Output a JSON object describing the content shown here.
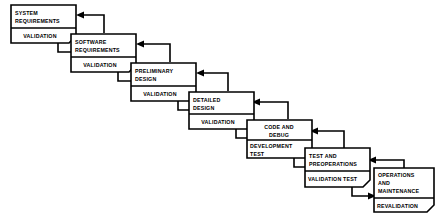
{
  "diagram": {
    "type": "waterfall-model",
    "stages": [
      {
        "id": "system-requirements",
        "phase_lines": [
          "SYSTEM",
          "REQUIREMENTS"
        ],
        "phase_align": "start",
        "validation_lines": [
          "VALIDATION"
        ],
        "validation_align": "center"
      },
      {
        "id": "software-requirements",
        "phase_lines": [
          "SOFTWARE",
          "REQUIREMENTS"
        ],
        "phase_align": "start",
        "validation_lines": [
          "VALIDATION"
        ],
        "validation_align": "center"
      },
      {
        "id": "preliminary-design",
        "phase_lines": [
          "PRELIMINARY",
          "DESIGN"
        ],
        "phase_align": "start",
        "validation_lines": [
          "VALIDATION"
        ],
        "validation_align": "center"
      },
      {
        "id": "detailed-design",
        "phase_lines": [
          "DETAILED",
          "DESIGN"
        ],
        "phase_align": "start",
        "validation_lines": [
          "VALIDATION"
        ],
        "validation_align": "center"
      },
      {
        "id": "code-and-debug",
        "phase_lines": [
          "CODE AND",
          "DEBUG"
        ],
        "phase_align": "center",
        "validation_lines": [
          "DEVELOPMENT",
          "TEST"
        ],
        "validation_align": "start"
      },
      {
        "id": "test-and-preoperations",
        "phase_lines": [
          "TEST AND",
          "PREOPERATIONS"
        ],
        "phase_align": "start",
        "validation_lines": [
          "VALIDATION TEST"
        ],
        "validation_align": "start"
      },
      {
        "id": "operations-and-maintenance",
        "phase_lines": [
          "OPERATIONS",
          "AND",
          "MAINTENANCE"
        ],
        "phase_align": "start",
        "validation_lines": [
          "REVALIDATION"
        ],
        "validation_align": "start"
      }
    ],
    "colors": {
      "stroke": "#000000",
      "fill": "#ffffff",
      "background": "#ffffff"
    }
  }
}
